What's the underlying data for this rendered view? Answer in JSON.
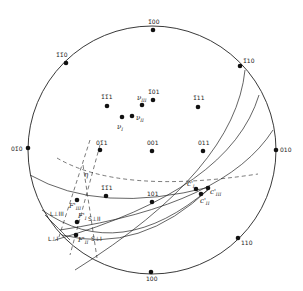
{
  "diagram": {
    "type": "stereographic-projection",
    "primitive_circle": {
      "cx": 152,
      "cy": 148,
      "r": 124
    },
    "poles": [
      {
        "id": "p-100t",
        "label": "1̄00",
        "x": 153,
        "y": 30,
        "lx": 148,
        "ly": 24
      },
      {
        "id": "p-1b1b0",
        "label": "1̄1̄0",
        "x": 66,
        "y": 63,
        "lx": 56,
        "ly": 57
      },
      {
        "id": "p-1b10",
        "label": "1̄10",
        "x": 240,
        "y": 66,
        "lx": 243,
        "ly": 63
      },
      {
        "id": "p-01b0",
        "label": "01̄0",
        "x": 28,
        "y": 148,
        "lx": 11,
        "ly": 151
      },
      {
        "id": "p-010",
        "label": "010",
        "x": 276,
        "y": 148,
        "lx": 280,
        "ly": 151
      },
      {
        "id": "p-110",
        "label": "110",
        "x": 238,
        "y": 238,
        "lx": 241,
        "ly": 245
      },
      {
        "id": "p-100b",
        "label": "100",
        "x": 151,
        "y": 272,
        "lx": 146,
        "ly": 281
      },
      {
        "id": "p-1b1b1",
        "label": "1̄1̄1",
        "x": 107,
        "y": 106,
        "lx": 101,
        "ly": 99
      },
      {
        "id": "p-1b01",
        "label": "1̄01",
        "x": 153,
        "y": 100,
        "lx": 148,
        "ly": 94
      },
      {
        "id": "p-1b11",
        "label": "1̄11",
        "x": 198,
        "y": 107,
        "lx": 193,
        "ly": 100
      },
      {
        "id": "p-01b1",
        "label": "01̄1",
        "x": 100,
        "y": 150,
        "lx": 96,
        "ly": 145
      },
      {
        "id": "p-001",
        "label": "001",
        "x": 152,
        "y": 151,
        "lx": 147,
        "ly": 145
      },
      {
        "id": "p-011",
        "label": "011",
        "x": 203,
        "y": 151,
        "lx": 198,
        "ly": 145
      },
      {
        "id": "p-11b1",
        "label": "1̄1̄1",
        "x": 106,
        "y": 196,
        "lx": 101,
        "ly": 190
      },
      {
        "id": "p-101",
        "label": "101",
        "x": 152,
        "y": 202,
        "lx": 147,
        "ly": 196
      }
    ],
    "special_points": [
      {
        "id": "nu-III",
        "label": "ν",
        "sub": "III",
        "x": 142,
        "y": 105,
        "lx": 137,
        "ly": 100
      },
      {
        "id": "nu-I",
        "label": "ν",
        "sub": "I",
        "x": 122,
        "y": 117,
        "lx": 117,
        "ly": 128
      },
      {
        "id": "nu-II",
        "label": "ν",
        "sub": "II",
        "x": 132,
        "y": 116,
        "lx": 136,
        "ly": 120
      },
      {
        "id": "c-I",
        "label": "c'",
        "sub": "I",
        "x": 196,
        "y": 189,
        "lx": 187,
        "ly": 186
      },
      {
        "id": "c-III",
        "label": "c'",
        "sub": "III",
        "x": 208,
        "y": 188,
        "lx": 210,
        "ly": 196
      },
      {
        "id": "c-II",
        "label": "c'",
        "sub": "II",
        "x": 201,
        "y": 194,
        "lx": 200,
        "ly": 203
      },
      {
        "id": "f-III",
        "label": "F'",
        "sub": "III",
        "x": 77,
        "y": 200,
        "lx": 69,
        "ly": 208
      },
      {
        "id": "f-I2",
        "label": "F'",
        "sub": "I",
        "x": 77,
        "y": 222,
        "lx": 78,
        "ly": 218
      },
      {
        "id": "f-II",
        "label": "F'",
        "sub": "II",
        "x": 76,
        "y": 235,
        "lx": 78,
        "ly": 241
      }
    ],
    "annotations": [
      {
        "id": "eta",
        "label": "η",
        "x": 84,
        "y": 177
      },
      {
        "id": "L-III",
        "label": "L⊥III",
        "x": 52,
        "y": 216
      },
      {
        "id": "S-II",
        "label": "S⊥II",
        "x": 88,
        "y": 221
      },
      {
        "id": "L-I",
        "label": "L⊥I",
        "x": 50,
        "y": 241
      },
      {
        "id": "S-I",
        "label": "S⊥I",
        "x": 91,
        "y": 241
      }
    ],
    "colors": {
      "line": "#222222",
      "dot": "#111111",
      "background": "#ffffff"
    }
  }
}
